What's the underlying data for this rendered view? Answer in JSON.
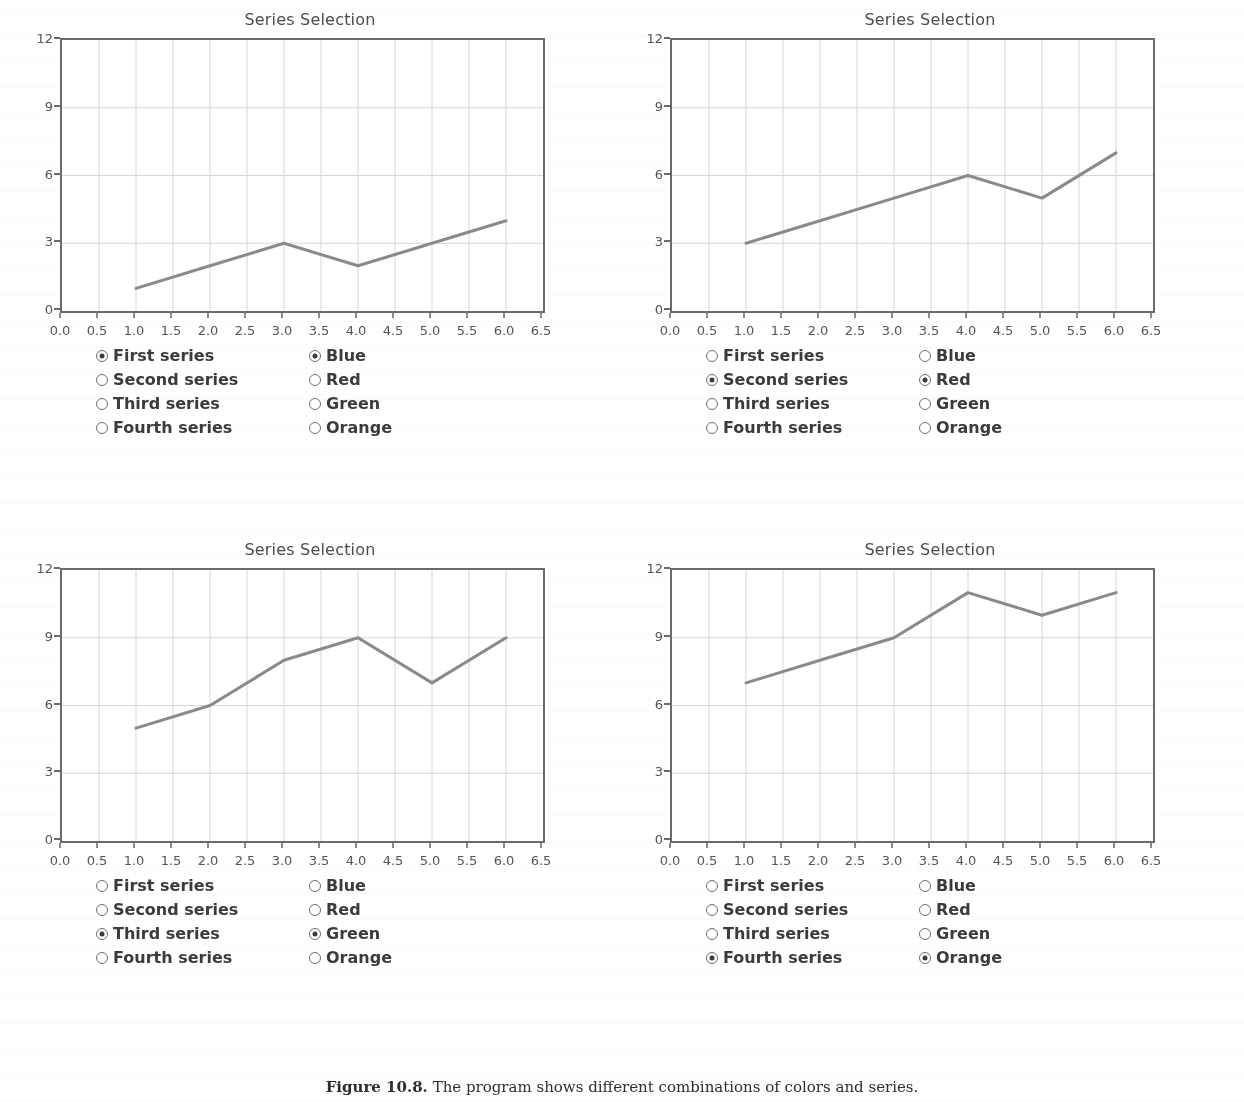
{
  "page": {
    "caption_label": "Figure 10.8.",
    "caption_text": "The program shows different combinations of colors and series."
  },
  "axes": {
    "xticks": [
      "0.0",
      "0.5",
      "1.0",
      "1.5",
      "2.0",
      "2.5",
      "3.0",
      "3.5",
      "4.0",
      "4.5",
      "5.0",
      "5.5",
      "6.0",
      "6.5"
    ],
    "yticks": [
      "0",
      "3",
      "6",
      "9",
      "12"
    ],
    "xlim": [
      0,
      6.5
    ],
    "ylim": [
      0,
      12
    ]
  },
  "series_options": [
    "First series",
    "Second series",
    "Third series",
    "Fourth series"
  ],
  "color_options": [
    "Blue",
    "Red",
    "Green",
    "Orange"
  ],
  "panels": [
    {
      "title": "Series Selection",
      "selected_series": "First series",
      "selected_color": "Blue",
      "series_checked": [
        true,
        false,
        false,
        false
      ],
      "color_checked": [
        true,
        false,
        false,
        false
      ]
    },
    {
      "title": "Series Selection",
      "selected_series": "Second series",
      "selected_color": "Red",
      "series_checked": [
        false,
        true,
        false,
        false
      ],
      "color_checked": [
        false,
        true,
        false,
        false
      ]
    },
    {
      "title": "Series Selection",
      "selected_series": "Third series",
      "selected_color": "Green",
      "series_checked": [
        false,
        false,
        true,
        false
      ],
      "color_checked": [
        false,
        false,
        true,
        false
      ]
    },
    {
      "title": "Series Selection",
      "selected_series": "Fourth series",
      "selected_color": "Orange",
      "series_checked": [
        false,
        false,
        false,
        true
      ],
      "color_checked": [
        false,
        false,
        false,
        true
      ]
    }
  ],
  "chart_data": [
    {
      "type": "line",
      "title": "Series Selection",
      "name": "First series",
      "color_label": "Blue",
      "line_color": "#8a8a8a",
      "x": [
        1,
        2,
        3,
        4,
        5,
        6
      ],
      "values": [
        1,
        2,
        3,
        2,
        3,
        4
      ],
      "xlabel": "",
      "ylabel": "",
      "xlim": [
        0,
        6.5
      ],
      "ylim": [
        0,
        12
      ],
      "xticks": [
        "0.0",
        "0.5",
        "1.0",
        "1.5",
        "2.0",
        "2.5",
        "3.0",
        "3.5",
        "4.0",
        "4.5",
        "5.0",
        "5.5",
        "6.0",
        "6.5"
      ],
      "yticks": [
        "0",
        "3",
        "6",
        "9",
        "12"
      ],
      "grid": true,
      "legend": "none"
    },
    {
      "type": "line",
      "title": "Series Selection",
      "name": "Second series",
      "color_label": "Red",
      "line_color": "#8a8a8a",
      "x": [
        1,
        2,
        3,
        4,
        5,
        6
      ],
      "values": [
        3,
        4,
        5,
        6,
        5,
        7
      ],
      "xlabel": "",
      "ylabel": "",
      "xlim": [
        0,
        6.5
      ],
      "ylim": [
        0,
        12
      ],
      "xticks": [
        "0.0",
        "0.5",
        "1.0",
        "1.5",
        "2.0",
        "2.5",
        "3.0",
        "3.5",
        "4.0",
        "4.5",
        "5.0",
        "5.5",
        "6.0",
        "6.5"
      ],
      "yticks": [
        "0",
        "3",
        "6",
        "9",
        "12"
      ],
      "grid": true,
      "legend": "none"
    },
    {
      "type": "line",
      "title": "Series Selection",
      "name": "Third series",
      "color_label": "Green",
      "line_color": "#8a8a8a",
      "x": [
        1,
        2,
        3,
        4,
        5,
        6
      ],
      "values": [
        5,
        6,
        8,
        9,
        7,
        9
      ],
      "xlabel": "",
      "ylabel": "",
      "xlim": [
        0,
        6.5
      ],
      "ylim": [
        0,
        12
      ],
      "xticks": [
        "0.0",
        "0.5",
        "1.0",
        "1.5",
        "2.0",
        "2.5",
        "3.0",
        "3.5",
        "4.0",
        "4.5",
        "5.0",
        "5.5",
        "6.0",
        "6.5"
      ],
      "yticks": [
        "0",
        "3",
        "6",
        "9",
        "12"
      ],
      "grid": true,
      "legend": "none"
    },
    {
      "type": "line",
      "title": "Series Selection",
      "name": "Fourth series",
      "color_label": "Orange",
      "line_color": "#8a8a8a",
      "x": [
        1,
        2,
        3,
        4,
        5,
        6
      ],
      "values": [
        7,
        8,
        9,
        11,
        10,
        11
      ],
      "xlabel": "",
      "ylabel": "",
      "xlim": [
        0,
        6.5
      ],
      "ylim": [
        0,
        12
      ],
      "xticks": [
        "0.0",
        "0.5",
        "1.0",
        "1.5",
        "2.0",
        "2.5",
        "3.0",
        "3.5",
        "4.0",
        "4.5",
        "5.0",
        "5.5",
        "6.0",
        "6.5"
      ],
      "yticks": [
        "0",
        "3",
        "6",
        "9",
        "12"
      ],
      "grid": true,
      "legend": "none"
    }
  ]
}
